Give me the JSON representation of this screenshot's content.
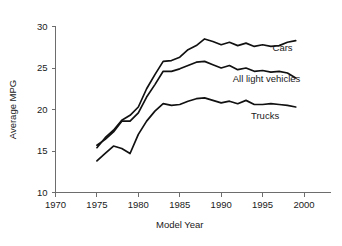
{
  "chart_data": {
    "type": "line",
    "title": "",
    "xlabel": "Model Year",
    "ylabel": "Average MPG",
    "xlim": [
      1970,
      2001.5
    ],
    "ylim": [
      10,
      30
    ],
    "xticks": [
      1970,
      1975,
      1980,
      1985,
      1990,
      1995,
      2000
    ],
    "yticks": [
      10,
      15,
      20,
      25,
      30
    ],
    "xtick_labels": [
      "1970",
      "1975",
      "1980",
      "1985",
      "1990",
      "1995",
      "2000"
    ],
    "ytick_labels": [
      "10",
      "15",
      "20",
      "25",
      "30"
    ],
    "grid": false,
    "legend_position": "inline-right",
    "x": [
      1975,
      1976,
      1977,
      1978,
      1979,
      1980,
      1981,
      1982,
      1983,
      1984,
      1985,
      1986,
      1987,
      1988,
      1989,
      1990,
      1991,
      1992,
      1993,
      1994,
      1995,
      1996,
      1997,
      1998,
      1999
    ],
    "series": [
      {
        "name": "Cars",
        "label": "Cars",
        "color": "#111111",
        "values": [
          15.4,
          16.6,
          17.5,
          18.7,
          19.3,
          20.3,
          22.5,
          24.2,
          25.8,
          25.9,
          26.3,
          27.2,
          27.7,
          28.5,
          28.2,
          27.8,
          28.1,
          27.7,
          28.0,
          27.6,
          27.8,
          27.6,
          27.7,
          28.1,
          28.3
        ],
        "end_value": 28.1
      },
      {
        "name": "All light vehicles",
        "label": "All light vehicles",
        "color": "#111111",
        "values": [
          15.7,
          16.4,
          17.3,
          18.6,
          18.6,
          19.6,
          21.5,
          23.0,
          24.6,
          24.6,
          24.9,
          25.3,
          25.7,
          25.8,
          25.4,
          25.0,
          25.3,
          24.8,
          25.0,
          24.6,
          24.7,
          24.5,
          24.6,
          24.4,
          23.8
        ],
        "end_value": 23.8
      },
      {
        "name": "Trucks",
        "label": "Trucks",
        "color": "#111111",
        "values": [
          13.8,
          14.7,
          15.6,
          15.3,
          14.7,
          17.0,
          18.6,
          19.8,
          20.7,
          20.5,
          20.6,
          21.0,
          21.3,
          21.4,
          21.1,
          20.8,
          21.0,
          20.7,
          21.1,
          20.6,
          20.6,
          20.7,
          20.6,
          20.5,
          20.3
        ],
        "end_value": 20.3
      }
    ],
    "annotations": [
      {
        "text": "Cars",
        "x": 1996.2,
        "y": 27.05
      },
      {
        "text": "All light vehicles",
        "x": 1991.4,
        "y": 23.35
      },
      {
        "text": "Trucks",
        "x": 1993.6,
        "y": 18.85
      }
    ]
  }
}
